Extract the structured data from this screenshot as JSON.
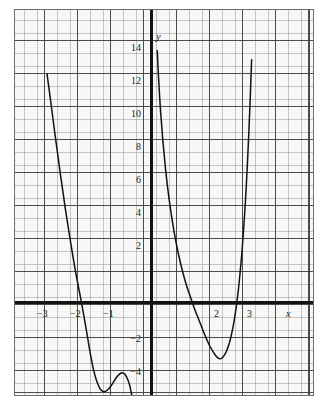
{
  "chart_data": {
    "type": "line",
    "title": "",
    "xlabel": "x",
    "ylabel": "y",
    "grid": true,
    "minor_grid": true,
    "minor_ticks_per_unit": 5,
    "legend": "none",
    "xlim": [
      -4.09,
      5.0
    ],
    "ylim": [
      -6.4,
      17.6
    ],
    "x_ticks": [
      -3,
      -2,
      -1,
      2,
      3
    ],
    "x_tick_labels": [
      "−3",
      "−2",
      "−1",
      "2",
      "3"
    ],
    "y_ticks": [
      14,
      12,
      10,
      8,
      6,
      4,
      2,
      -2,
      -4
    ],
    "y_tick_labels": [
      "14",
      "12",
      "10",
      "8",
      "6",
      "4",
      "2",
      "−2",
      "−4"
    ],
    "axis_label_x": "x",
    "axis_label_y": "y",
    "series": [
      {
        "name": "branch-left",
        "comment": "descends from upper-left, local min then local max, exits bottom",
        "points": [
          [
            -3.16,
            13.85
          ],
          [
            -3.05,
            12.2
          ],
          [
            -2.9,
            9.9
          ],
          [
            -2.75,
            7.7
          ],
          [
            -2.6,
            5.6
          ],
          [
            -2.45,
            3.7
          ],
          [
            -2.3,
            1.9
          ],
          [
            -2.15,
            0.35
          ],
          [
            -2.05,
            -0.75
          ],
          [
            -1.95,
            -1.9
          ],
          [
            -1.85,
            -3.1
          ],
          [
            -1.75,
            -4.1
          ],
          [
            -1.65,
            -4.8
          ],
          [
            -1.55,
            -5.25
          ],
          [
            -1.48,
            -5.38
          ],
          [
            -1.4,
            -5.4
          ],
          [
            -1.32,
            -5.3
          ],
          [
            -1.24,
            -5.12
          ],
          [
            -1.16,
            -4.88
          ],
          [
            -1.08,
            -4.62
          ],
          [
            -1.0,
            -4.42
          ],
          [
            -0.93,
            -4.3
          ],
          [
            -0.88,
            -4.27
          ],
          [
            -0.83,
            -4.3
          ],
          [
            -0.78,
            -4.42
          ],
          [
            -0.72,
            -4.65
          ],
          [
            -0.66,
            -5.0
          ],
          [
            -0.62,
            -5.35
          ],
          [
            -0.58,
            -5.75
          ],
          [
            -0.55,
            -6.1
          ],
          [
            -0.53,
            -6.4
          ]
        ]
      },
      {
        "name": "branch-right",
        "comment": "enters from top near y-axis, crosses x-axis, min near x=2, rises steeply",
        "points": [
          [
            0.18,
            15.25
          ],
          [
            0.22,
            13.6
          ],
          [
            0.28,
            11.6
          ],
          [
            0.35,
            9.8
          ],
          [
            0.43,
            8.1
          ],
          [
            0.52,
            6.55
          ],
          [
            0.62,
            5.15
          ],
          [
            0.72,
            3.95
          ],
          [
            0.83,
            2.85
          ],
          [
            0.95,
            1.85
          ],
          [
            1.07,
            1.0
          ],
          [
            1.2,
            0.25
          ],
          [
            1.32,
            -0.45
          ],
          [
            1.45,
            -1.1
          ],
          [
            1.57,
            -1.72
          ],
          [
            1.68,
            -2.25
          ],
          [
            1.78,
            -2.68
          ],
          [
            1.88,
            -3.02
          ],
          [
            1.96,
            -3.25
          ],
          [
            2.03,
            -3.38
          ],
          [
            2.08,
            -3.42
          ],
          [
            2.14,
            -3.38
          ],
          [
            2.2,
            -3.25
          ],
          [
            2.28,
            -2.95
          ],
          [
            2.36,
            -2.5
          ],
          [
            2.44,
            -1.85
          ],
          [
            2.52,
            -1.0
          ],
          [
            2.6,
            0.1
          ],
          [
            2.67,
            1.35
          ],
          [
            2.74,
            2.9
          ],
          [
            2.8,
            4.5
          ],
          [
            2.86,
            6.4
          ],
          [
            2.91,
            8.3
          ],
          [
            2.96,
            10.5
          ],
          [
            3.0,
            12.5
          ],
          [
            3.04,
            14.7
          ]
        ]
      }
    ]
  },
  "labels": {
    "y_axis_name": "y",
    "x_axis_name": "x",
    "y14": "14",
    "y12": "12",
    "y10": "10",
    "y8": "8",
    "y6": "6",
    "y4": "4",
    "y2": "2",
    "ym2": "−2",
    "ym4": "−4",
    "xm3": "−3",
    "xm2": "−2",
    "xm1": "−1",
    "x2": "2",
    "x3": "3"
  },
  "style": {
    "curve_color": "#111111",
    "axis_color": "#131313",
    "major_grid_color": "#3a3a3a",
    "minor_grid_color": "#787878",
    "plot_background": "#f7f7f5",
    "border_color": "#6f6f6f"
  }
}
